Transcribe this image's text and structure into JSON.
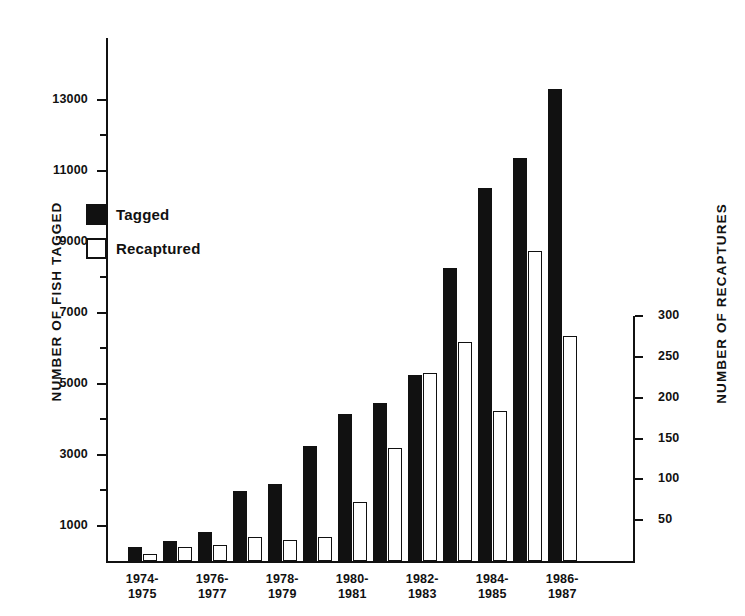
{
  "chart_data": {
    "type": "bar",
    "title": "",
    "xlabel": "",
    "ylabel": "NUMBER OF FISH TAGGED",
    "y2label": "NUMBER OF RECAPTURES",
    "grid": false,
    "legend_position": "upper-left-inside",
    "ylim": [
      0,
      14000
    ],
    "y2lim": [
      0,
      345
    ],
    "yticks": [
      1000,
      3000,
      5000,
      7000,
      9000,
      11000,
      13000
    ],
    "ytick_labels": [
      "1000",
      "3000",
      "5000",
      "7000",
      "9000",
      "11000",
      "13000"
    ],
    "yminor_ticks": [
      2000,
      4000,
      6000,
      8000,
      10000,
      12000
    ],
    "y2ticks": [
      50,
      100,
      150,
      200,
      250,
      300
    ],
    "y2tick_labels": [
      "50",
      "100",
      "150",
      "200",
      "250",
      "300"
    ],
    "categories": [
      "1974-1975",
      "",
      "1976-1977",
      "",
      "1978-1979",
      "",
      "1980-1981",
      "",
      "1982-1983",
      "",
      "1984-1985",
      "",
      "1986-1987"
    ],
    "xtick_labels": [
      {
        "index": 0,
        "line1": "1974-",
        "line2": "1975"
      },
      {
        "index": 2,
        "line1": "1976-",
        "line2": "1977"
      },
      {
        "index": 4,
        "line1": "1978-",
        "line2": "1979"
      },
      {
        "index": 6,
        "line1": "1980-",
        "line2": "1981"
      },
      {
        "index": 8,
        "line1": "1982-",
        "line2": "1983"
      },
      {
        "index": 10,
        "line1": "1984-",
        "line2": "1985"
      },
      {
        "index": 12,
        "line1": "1986-",
        "line2": "1987"
      }
    ],
    "series": [
      {
        "name": "Tagged",
        "axis": "left",
        "color": "#111111",
        "style": "filled",
        "values": [
          390,
          550,
          830,
          1980,
          2180,
          3250,
          4150,
          4450,
          5250,
          8250,
          10500,
          11350,
          13300
        ]
      },
      {
        "name": "Recaptured",
        "axis": "right",
        "color": "#ffffff",
        "style": "hollow",
        "values": [
          8,
          17,
          20,
          30,
          26,
          30,
          72,
          138,
          230,
          268,
          184,
          380,
          275
        ]
      }
    ]
  },
  "legend": {
    "items": [
      {
        "label": "Tagged",
        "swatch": "filled"
      },
      {
        "label": "Recaptured",
        "swatch": "hollow"
      }
    ]
  }
}
